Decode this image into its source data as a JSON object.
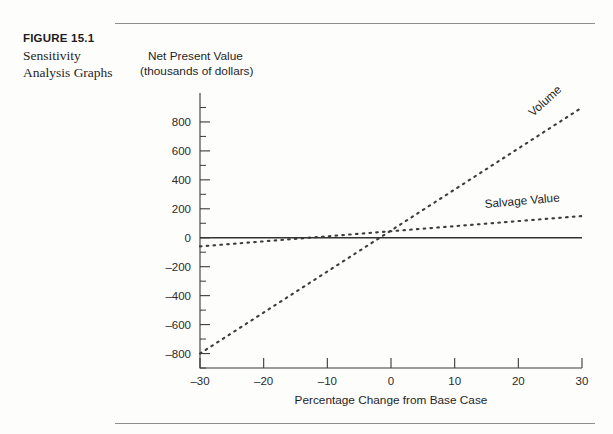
{
  "figure": {
    "number_label": "FIGURE 15.1",
    "caption_line1": "Sensitivity",
    "caption_line2": "Analysis Graphs"
  },
  "chart_data": {
    "type": "line",
    "title": "",
    "xlabel": "Percentage Change from Base Case",
    "ylabel_line1": "Net Present Value",
    "ylabel_line2": "(thousands of dollars)",
    "xlim": [
      -30,
      30
    ],
    "ylim": [
      -900,
      1000
    ],
    "xticks": [
      -30,
      -20,
      -10,
      0,
      10,
      20,
      30
    ],
    "xticklabels": [
      "–30",
      "–20",
      "–10",
      "0",
      "10",
      "20",
      "30"
    ],
    "yticks": [
      -800,
      -600,
      -400,
      -200,
      0,
      200,
      400,
      600,
      800
    ],
    "yticklabels": [
      "–800",
      "–600",
      "–400",
      "–200",
      "0",
      "200",
      "400",
      "600",
      "800"
    ],
    "yminorticks": [
      -900,
      -700,
      -500,
      -300,
      -100,
      100,
      300,
      500,
      700,
      900
    ],
    "grid": false,
    "legend_position": "inline-at-line-end",
    "series": [
      {
        "name": "Volume",
        "style": "dotted",
        "label": "Volume",
        "x": [
          -30,
          30
        ],
        "y": [
          -800,
          900
        ]
      },
      {
        "name": "Salvage Value",
        "style": "dotted",
        "label": "Salvage Value",
        "x": [
          -30,
          30
        ],
        "y": [
          -60,
          150
        ]
      },
      {
        "name": "Base Line",
        "style": "solid",
        "label": "",
        "x": [
          -30,
          30
        ],
        "y": [
          0,
          0
        ]
      }
    ]
  }
}
